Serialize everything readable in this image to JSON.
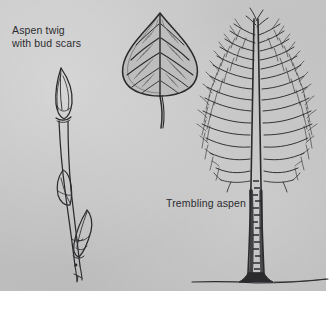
{
  "figure": {
    "kind": "botanical-illustration-plate",
    "background_color": "#c2c2c2",
    "ink_color": "#2b2b2e",
    "page_color": "#ffffff"
  },
  "labels": {
    "twig": "Aspen twig\nwith bud scars",
    "tree": "Trembling aspen"
  },
  "illustrations": [
    {
      "name": "aspen-twig",
      "description": "Slender upright twig with pointed terminal bud, two lateral buds and bud scars",
      "position": "left"
    },
    {
      "name": "aspen-leaf",
      "description": "Ovate to deltoid leaf with finely toothed margin, pinnate venation and long slender petiole",
      "position": "center-top"
    },
    {
      "name": "trembling-aspen-tree",
      "description": "Leafless mature aspen with narrow conical crown, strong central leader, fine branching and pale marked trunk on a ground line",
      "position": "right"
    }
  ]
}
